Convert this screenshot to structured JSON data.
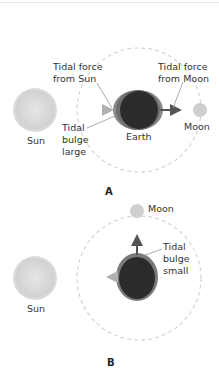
{
  "panel_a": {
    "letter": "A",
    "sun_label": "Sun",
    "earth_label": "Earth",
    "moon_label": "Moon",
    "tidal_force_sun_line1": "Tidal force",
    "tidal_force_sun_line2": "from Sun",
    "tidal_force_moon_line1": "Tidal force",
    "tidal_force_moon_line2": "from Moon",
    "bulge_line1": "Tidal",
    "bulge_line2": "bulge",
    "bulge_line3": "large"
  },
  "panel_b": {
    "letter": "B",
    "sun_label": "Sun",
    "moon_label": "Moon",
    "bulge_line1": "Tidal",
    "bulge_line2": "bulge",
    "bulge_line3": "small"
  },
  "colors": {
    "sun": "#d8d8d8",
    "earth": "#2a2a2a",
    "bulge": "#7a7a7a",
    "moon": "#cfcfcf",
    "orbit": "#d0d0d0",
    "arrow_moon": "#5a5a5a",
    "arrow_sun": "#b5b5b5"
  }
}
